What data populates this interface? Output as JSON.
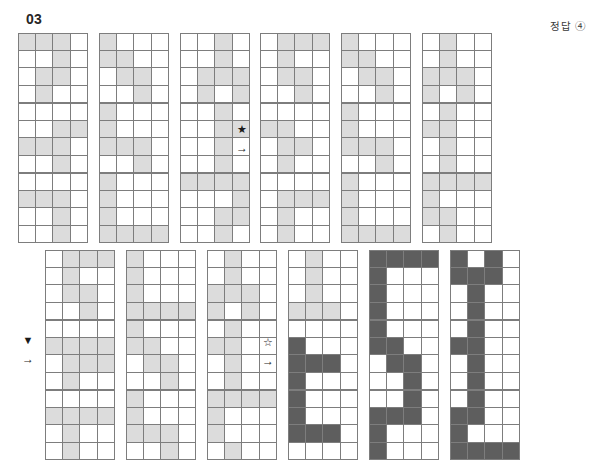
{
  "header": {
    "number": "03",
    "answer": "정답 ④"
  },
  "legend": {
    "light_color": "#dcdcdc",
    "dark_color": "#5e5e5e",
    "grid_line_color": "#7d7d7d"
  },
  "markers": {
    "star_filled": {
      "glyph": "★",
      "arrow": "→"
    },
    "star_outline": {
      "glyph": "☆",
      "arrow": "→"
    },
    "triangle_down": {
      "glyph": "▼",
      "arrow": "→"
    }
  },
  "blocks": [
    {
      "id": "top-left-block",
      "fill": "light",
      "grids": [
        {
          "id": "tl-r1c1",
          "cells": [
            [
              1,
              1,
              1,
              0
            ],
            [
              0,
              0,
              1,
              0
            ],
            [
              0,
              1,
              1,
              0
            ],
            [
              0,
              1,
              0,
              0
            ]
          ]
        },
        {
          "id": "tl-r1c2",
          "cells": [
            [
              1,
              0,
              0,
              0
            ],
            [
              1,
              1,
              0,
              0
            ],
            [
              0,
              1,
              1,
              0
            ],
            [
              0,
              0,
              1,
              0
            ]
          ]
        },
        {
          "id": "tl-r1c3",
          "cells": [
            [
              0,
              0,
              1,
              0
            ],
            [
              0,
              0,
              1,
              0
            ],
            [
              0,
              1,
              1,
              1
            ],
            [
              0,
              1,
              0,
              1
            ]
          ]
        },
        {
          "id": "tl-r2c1",
          "cells": [
            [
              0,
              0,
              0,
              0
            ],
            [
              0,
              0,
              1,
              1
            ],
            [
              1,
              1,
              1,
              0
            ],
            [
              0,
              0,
              1,
              0
            ]
          ]
        },
        {
          "id": "tl-r2c2",
          "cells": [
            [
              1,
              0,
              0,
              0
            ],
            [
              1,
              0,
              0,
              0
            ],
            [
              1,
              1,
              1,
              0
            ],
            [
              0,
              0,
              1,
              0
            ]
          ]
        },
        {
          "id": "tl-r2c3",
          "cells": [
            [
              0,
              0,
              1,
              0
            ],
            [
              0,
              0,
              1,
              1
            ],
            [
              0,
              0,
              1,
              0
            ],
            [
              0,
              0,
              1,
              0
            ]
          ]
        },
        {
          "id": "tl-r3c1",
          "cells": [
            [
              0,
              0,
              0,
              0
            ],
            [
              1,
              1,
              1,
              0
            ],
            [
              0,
              0,
              1,
              0
            ],
            [
              0,
              0,
              1,
              0
            ]
          ]
        },
        {
          "id": "tl-r3c2",
          "cells": [
            [
              1,
              0,
              0,
              0
            ],
            [
              1,
              0,
              0,
              0
            ],
            [
              1,
              0,
              0,
              0
            ],
            [
              1,
              1,
              1,
              1
            ]
          ]
        },
        {
          "id": "tl-r3c3",
          "cells": [
            [
              1,
              1,
              1,
              1
            ],
            [
              0,
              0,
              0,
              1
            ],
            [
              0,
              0,
              1,
              1
            ],
            [
              0,
              0,
              1,
              0
            ]
          ]
        }
      ]
    },
    {
      "id": "top-right-block",
      "fill": "light",
      "grids": [
        {
          "id": "tr-r1c1",
          "cells": [
            [
              0,
              1,
              1,
              1
            ],
            [
              0,
              1,
              0,
              0
            ],
            [
              0,
              1,
              1,
              0
            ],
            [
              0,
              0,
              1,
              0
            ]
          ]
        },
        {
          "id": "tr-r1c2",
          "cells": [
            [
              1,
              0,
              0,
              0
            ],
            [
              1,
              1,
              0,
              0
            ],
            [
              0,
              1,
              1,
              0
            ],
            [
              0,
              0,
              1,
              0
            ]
          ]
        },
        {
          "id": "tr-r1c3",
          "cells": [
            [
              0,
              1,
              0,
              0
            ],
            [
              0,
              1,
              0,
              0
            ],
            [
              1,
              1,
              1,
              0
            ],
            [
              1,
              0,
              1,
              0
            ]
          ]
        },
        {
          "id": "tr-r2c1",
          "cells": [
            [
              0,
              0,
              0,
              0
            ],
            [
              1,
              1,
              0,
              0
            ],
            [
              0,
              1,
              1,
              0
            ],
            [
              0,
              1,
              0,
              0
            ]
          ]
        },
        {
          "id": "tr-r2c2",
          "cells": [
            [
              1,
              0,
              0,
              0
            ],
            [
              1,
              0,
              0,
              0
            ],
            [
              1,
              1,
              1,
              0
            ],
            [
              0,
              0,
              1,
              0
            ]
          ]
        },
        {
          "id": "tr-r2c3",
          "cells": [
            [
              0,
              1,
              0,
              0
            ],
            [
              1,
              1,
              0,
              0
            ],
            [
              0,
              1,
              0,
              0
            ],
            [
              0,
              1,
              0,
              0
            ]
          ]
        },
        {
          "id": "tr-r3c1",
          "cells": [
            [
              0,
              0,
              0,
              0
            ],
            [
              0,
              1,
              1,
              1
            ],
            [
              0,
              1,
              0,
              0
            ],
            [
              0,
              1,
              0,
              0
            ]
          ]
        },
        {
          "id": "tr-r3c2",
          "cells": [
            [
              1,
              0,
              0,
              0
            ],
            [
              1,
              0,
              0,
              0
            ],
            [
              1,
              0,
              0,
              0
            ],
            [
              1,
              1,
              1,
              1
            ]
          ]
        },
        {
          "id": "tr-r3c3",
          "cells": [
            [
              1,
              1,
              1,
              1
            ],
            [
              1,
              0,
              0,
              0
            ],
            [
              1,
              1,
              0,
              0
            ],
            [
              0,
              1,
              0,
              0
            ]
          ]
        }
      ]
    },
    {
      "id": "bottom-left-block",
      "fill": "light",
      "grids": [
        {
          "id": "bl-r1c1",
          "cells": [
            [
              0,
              1,
              1,
              1
            ],
            [
              0,
              1,
              0,
              0
            ],
            [
              0,
              1,
              1,
              0
            ],
            [
              0,
              0,
              1,
              0
            ]
          ]
        },
        {
          "id": "bl-r1c2",
          "cells": [
            [
              1,
              0,
              0,
              0
            ],
            [
              1,
              0,
              0,
              0
            ],
            [
              1,
              0,
              0,
              0
            ],
            [
              1,
              1,
              1,
              1
            ]
          ]
        },
        {
          "id": "bl-r1c3",
          "cells": [
            [
              0,
              1,
              0,
              0
            ],
            [
              0,
              1,
              0,
              0
            ],
            [
              1,
              1,
              1,
              0
            ],
            [
              1,
              0,
              1,
              0
            ]
          ]
        },
        {
          "id": "bl-r2c1",
          "cells": [
            [
              0,
              0,
              0,
              0
            ],
            [
              1,
              1,
              1,
              1
            ],
            [
              0,
              1,
              1,
              1
            ],
            [
              0,
              1,
              0,
              0
            ]
          ]
        },
        {
          "id": "bl-r2c2",
          "cells": [
            [
              1,
              0,
              0,
              0
            ],
            [
              1,
              1,
              0,
              0
            ],
            [
              0,
              1,
              1,
              0
            ],
            [
              0,
              0,
              1,
              0
            ]
          ]
        },
        {
          "id": "bl-r2c3",
          "cells": [
            [
              0,
              1,
              0,
              0
            ],
            [
              1,
              1,
              0,
              0
            ],
            [
              0,
              1,
              0,
              0
            ],
            [
              0,
              1,
              0,
              0
            ]
          ]
        },
        {
          "id": "bl-r3c1",
          "cells": [
            [
              0,
              0,
              0,
              0
            ],
            [
              1,
              1,
              1,
              1
            ],
            [
              0,
              1,
              0,
              0
            ],
            [
              0,
              1,
              0,
              0
            ]
          ]
        },
        {
          "id": "bl-r3c2",
          "cells": [
            [
              1,
              0,
              0,
              0
            ],
            [
              1,
              0,
              0,
              0
            ],
            [
              1,
              1,
              1,
              0
            ],
            [
              0,
              0,
              1,
              0
            ]
          ]
        },
        {
          "id": "bl-r3c3",
          "cells": [
            [
              1,
              1,
              1,
              1
            ],
            [
              1,
              0,
              0,
              0
            ],
            [
              1,
              0,
              0,
              0
            ],
            [
              0,
              1,
              0,
              0
            ]
          ]
        }
      ]
    },
    {
      "id": "bottom-right-block",
      "fill": "mixed",
      "grids": [
        {
          "id": "br-r1c1",
          "fill": "light",
          "cells": [
            [
              0,
              1,
              0,
              0
            ],
            [
              0,
              1,
              0,
              0
            ],
            [
              0,
              1,
              0,
              0
            ],
            [
              1,
              1,
              1,
              0
            ]
          ]
        },
        {
          "id": "br-r1c2",
          "fill": "dark",
          "cells": [
            [
              1,
              1,
              1,
              1
            ],
            [
              1,
              0,
              0,
              0
            ],
            [
              1,
              0,
              0,
              0
            ],
            [
              1,
              0,
              0,
              0
            ]
          ]
        },
        {
          "id": "br-r1c3",
          "fill": "dark",
          "cells": [
            [
              1,
              0,
              1,
              0
            ],
            [
              1,
              1,
              1,
              0
            ],
            [
              0,
              1,
              0,
              0
            ],
            [
              0,
              1,
              0,
              0
            ]
          ]
        },
        {
          "id": "br-r2c1",
          "fill": "dark",
          "cells": [
            [
              0,
              0,
              0,
              0
            ],
            [
              1,
              0,
              0,
              0
            ],
            [
              1,
              1,
              1,
              0
            ],
            [
              1,
              0,
              0,
              0
            ]
          ]
        },
        {
          "id": "br-r2c2",
          "fill": "dark",
          "cells": [
            [
              1,
              0,
              0,
              0
            ],
            [
              1,
              1,
              0,
              0
            ],
            [
              0,
              1,
              1,
              0
            ],
            [
              0,
              0,
              1,
              0
            ]
          ]
        },
        {
          "id": "br-r2c3",
          "fill": "dark",
          "cells": [
            [
              0,
              1,
              0,
              0
            ],
            [
              1,
              1,
              0,
              0
            ],
            [
              0,
              1,
              0,
              0
            ],
            [
              0,
              1,
              0,
              0
            ]
          ]
        },
        {
          "id": "br-r3c1",
          "fill": "dark",
          "cells": [
            [
              1,
              0,
              0,
              0
            ],
            [
              1,
              0,
              0,
              0
            ],
            [
              1,
              1,
              1,
              0
            ],
            [
              0,
              0,
              0,
              0
            ]
          ]
        },
        {
          "id": "br-r3c2",
          "fill": "dark",
          "cells": [
            [
              0,
              0,
              1,
              0
            ],
            [
              1,
              1,
              1,
              0
            ],
            [
              1,
              0,
              0,
              0
            ],
            [
              1,
              0,
              0,
              0
            ]
          ]
        },
        {
          "id": "br-r3c3",
          "fill": "dark",
          "cells": [
            [
              0,
              1,
              0,
              0
            ],
            [
              1,
              1,
              0,
              0
            ],
            [
              1,
              0,
              0,
              0
            ],
            [
              1,
              1,
              1,
              1
            ]
          ]
        }
      ]
    }
  ],
  "layout": {
    "cell_size": 17.5,
    "grid_size": 70,
    "top_left_origin": {
      "x": 18,
      "y": 33
    },
    "top_right_origin": {
      "x": 260,
      "y": 33
    },
    "bottom_left_origin": {
      "x": 45,
      "y": 250
    },
    "bottom_right_origin": {
      "x": 288,
      "y": 250
    },
    "grid_gap_x": 81,
    "grid_gap_y": 70,
    "marker_star_filled": {
      "x": 236,
      "y": 124
    },
    "marker_star_outline": {
      "x": 262,
      "y": 337
    },
    "marker_triangle": {
      "x": 22,
      "y": 335
    }
  }
}
